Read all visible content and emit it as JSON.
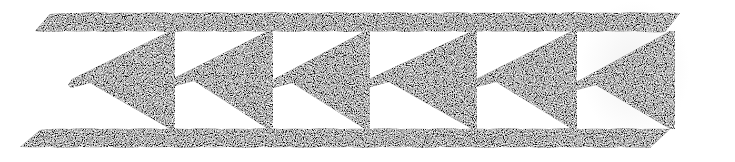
{
  "artwork": {
    "description": "Hand-drawn border pattern: row of black triangles pointing left between two horizontal bands",
    "ink_color": "#0a0a0a",
    "paper_color": "#ffffff",
    "top_band": {
      "x1": 50,
      "x2": 334,
      "y": 12,
      "height": 20
    },
    "bottom_band": {
      "x1": 40,
      "x2": 324,
      "y": 128,
      "height": 20
    },
    "triangle_count": 6,
    "triangles": [
      {
        "tip_x": 68,
        "tip_y": 85,
        "base_x": 172
      },
      {
        "tip_x": 172,
        "tip_y": 83,
        "base_x": 270
      },
      {
        "tip_x": 270,
        "tip_y": 85,
        "base_x": 367
      },
      {
        "tip_x": 367,
        "tip_y": 84,
        "base_x": 474
      },
      {
        "tip_x": 474,
        "tip_y": 84,
        "base_x": 574
      },
      {
        "tip_x": 574,
        "tip_y": 87,
        "base_x": 672
      }
    ]
  }
}
